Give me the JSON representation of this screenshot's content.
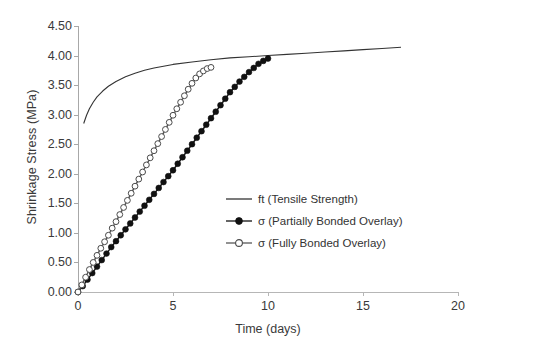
{
  "chart_data": {
    "type": "line",
    "title": "",
    "xlabel": "Time (days)",
    "ylabel": "Shrinkage Stress (MPa)",
    "xlim": [
      0,
      20
    ],
    "ylim": [
      0,
      4.5
    ],
    "xticks": [
      "0",
      "5",
      "10",
      "15",
      "20"
    ],
    "xtick_values": [
      0,
      5,
      10,
      15,
      20
    ],
    "yticks": [
      "0.00",
      "0.50",
      "1.00",
      "1.50",
      "2.00",
      "2.50",
      "3.00",
      "3.50",
      "4.00",
      "4.50"
    ],
    "ytick_values": [
      0,
      0.5,
      1.0,
      1.5,
      2.0,
      2.5,
      3.0,
      3.5,
      4.0,
      4.5
    ],
    "grid": false,
    "legend_position": "inside-lower-right",
    "series": [
      {
        "name": "ft (Tensile Strength)",
        "style": "solid-line",
        "marker": "none",
        "color": "#333333",
        "x": [
          0.3,
          0.45,
          0.6,
          0.8,
          1.0,
          1.3,
          1.6,
          2.0,
          2.5,
          3.0,
          3.5,
          4.0,
          4.5,
          5.0,
          6.0,
          7.0,
          8.0,
          9.0,
          10.0,
          11.0,
          12.0,
          13.0,
          14.0,
          15.0,
          16.0,
          17.0
        ],
        "y": [
          2.85,
          2.99,
          3.1,
          3.21,
          3.3,
          3.4,
          3.48,
          3.56,
          3.64,
          3.7,
          3.75,
          3.79,
          3.82,
          3.85,
          3.89,
          3.93,
          3.96,
          3.98,
          4.0,
          4.02,
          4.04,
          4.06,
          4.08,
          4.1,
          4.12,
          4.14
        ]
      },
      {
        "name": "σ (Partially Bonded Overlay)",
        "style": "line-with-markers",
        "marker": "filled-circle",
        "color": "#1a1a1a",
        "x": [
          0.0,
          0.25,
          0.5,
          0.75,
          1.0,
          1.25,
          1.5,
          1.75,
          2.0,
          2.25,
          2.5,
          2.75,
          3.0,
          3.25,
          3.5,
          3.75,
          4.0,
          4.25,
          4.5,
          4.75,
          5.0,
          5.25,
          5.5,
          5.75,
          6.0,
          6.25,
          6.5,
          6.75,
          7.0,
          7.25,
          7.5,
          7.75,
          8.0,
          8.25,
          8.5,
          8.75,
          9.0,
          9.25,
          9.5,
          9.75,
          10.0
        ],
        "y": [
          0.0,
          0.1,
          0.21,
          0.32,
          0.43,
          0.54,
          0.65,
          0.76,
          0.86,
          0.96,
          1.06,
          1.16,
          1.26,
          1.36,
          1.46,
          1.56,
          1.66,
          1.76,
          1.86,
          1.96,
          2.06,
          2.17,
          2.28,
          2.39,
          2.5,
          2.61,
          2.72,
          2.83,
          2.94,
          3.05,
          3.16,
          3.27,
          3.38,
          3.47,
          3.56,
          3.64,
          3.72,
          3.79,
          3.86,
          3.91,
          3.95
        ]
      },
      {
        "name": "σ (Fully Bonded Overlay)",
        "style": "line-with-markers",
        "marker": "open-circle",
        "color": "#555555",
        "x": [
          0.0,
          0.2,
          0.4,
          0.6,
          0.8,
          1.0,
          1.2,
          1.4,
          1.6,
          1.8,
          2.0,
          2.2,
          2.4,
          2.6,
          2.8,
          3.0,
          3.2,
          3.4,
          3.6,
          3.8,
          4.0,
          4.2,
          4.4,
          4.6,
          4.8,
          5.0,
          5.2,
          5.4,
          5.6,
          5.8,
          6.0,
          6.2,
          6.4,
          6.6,
          6.8,
          7.0
        ],
        "y": [
          0.0,
          0.12,
          0.25,
          0.38,
          0.5,
          0.62,
          0.74,
          0.85,
          0.96,
          1.08,
          1.19,
          1.31,
          1.43,
          1.55,
          1.67,
          1.79,
          1.91,
          2.03,
          2.15,
          2.27,
          2.39,
          2.51,
          2.63,
          2.75,
          2.87,
          2.99,
          3.1,
          3.21,
          3.32,
          3.43,
          3.53,
          3.62,
          3.69,
          3.74,
          3.78,
          3.8
        ]
      }
    ],
    "legend": [
      {
        "label": "ft (Tensile Strength)",
        "key": "solid-line"
      },
      {
        "label": "σ (Partially Bonded Overlay)",
        "key": "filled-circle-line"
      },
      {
        "label": "σ (Fully Bonded Overlay)",
        "key": "open-circle-line"
      }
    ]
  }
}
